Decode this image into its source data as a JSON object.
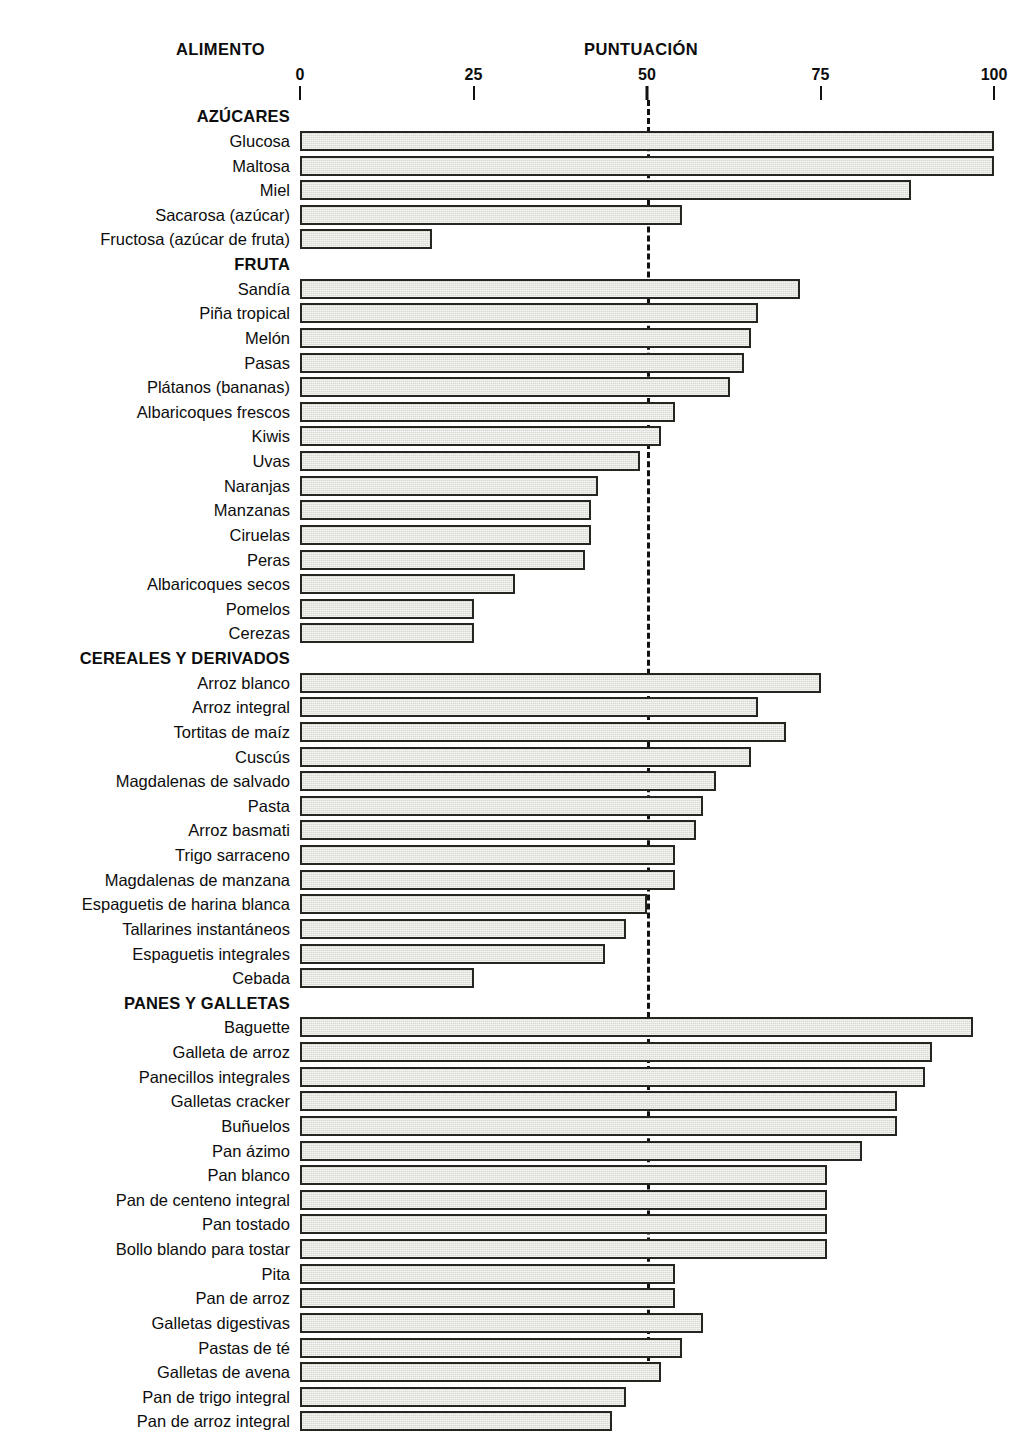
{
  "header": {
    "food_column": "ALIMENTO",
    "score_column": "PUNTUACIÓN"
  },
  "axis": {
    "ticks": [
      "0",
      "25",
      "50",
      "75",
      "100"
    ],
    "tick_values": [
      0,
      25,
      50,
      75,
      100
    ],
    "reference_line_value": 50
  },
  "chart_data": {
    "type": "bar",
    "orientation": "horizontal",
    "title": "PUNTUACIÓN",
    "xlabel": "PUNTUACIÓN",
    "ylabel": "ALIMENTO",
    "xlim": [
      0,
      100
    ],
    "xticks": [
      0,
      25,
      50,
      75,
      100
    ],
    "grid": false,
    "legend": "none",
    "annotations": [
      "Línea discontinua de referencia en 50"
    ],
    "groups": [
      {
        "name": "AZÚCARES",
        "categories": [
          "Glucosa",
          "Maltosa",
          "Miel",
          "Sacarosa (azúcar)",
          "Fructosa (azúcar de fruta)"
        ],
        "values": [
          100,
          100,
          88,
          55,
          19
        ]
      },
      {
        "name": "FRUTA",
        "categories": [
          "Sandía",
          "Piña tropical",
          "Melón",
          "Pasas",
          "Plátanos (bananas)",
          "Albaricoques frescos",
          "Kiwis",
          "Uvas",
          "Naranjas",
          "Manzanas",
          "Ciruelas",
          "Peras",
          "Albaricoques secos",
          "Pomelos",
          "Cerezas"
        ],
        "values": [
          72,
          66,
          65,
          64,
          62,
          54,
          52,
          49,
          43,
          42,
          42,
          41,
          31,
          25,
          25
        ]
      },
      {
        "name": "CEREALES Y DERIVADOS",
        "categories": [
          "Arroz blanco",
          "Arroz integral",
          "Tortitas de maíz",
          "Cuscús",
          "Magdalenas de salvado",
          "Pasta",
          "Arroz basmati",
          "Trigo sarraceno",
          "Magdalenas de manzana",
          "Espaguetis de harina blanca",
          "Tallarines instantáneos",
          "Espaguetis integrales",
          "Cebada"
        ],
        "values": [
          75,
          66,
          70,
          65,
          60,
          58,
          57,
          54,
          54,
          50,
          47,
          44,
          25
        ]
      },
      {
        "name": "PANES Y GALLETAS",
        "categories": [
          "Baguette",
          "Galleta de arroz",
          "Panecillos integrales",
          "Galletas cracker",
          "Buñuelos",
          "Pan ázimo",
          "Pan blanco",
          "Pan de centeno integral",
          "Pan tostado",
          "Bollo blando para tostar",
          "Pita",
          "Pan de arroz",
          "Galletas digestivas",
          "Pastas de té",
          "Galletas de avena",
          "Pan de trigo integral",
          "Pan de arroz integral"
        ],
        "values": [
          97,
          91,
          90,
          86,
          86,
          81,
          76,
          76,
          76,
          76,
          54,
          54,
          58,
          55,
          52,
          47,
          45
        ]
      }
    ]
  },
  "style": {
    "bar_fill": "#d9d9d4",
    "bar_border": "#26251f",
    "text_color": "#0d0d0d",
    "background": "#ffffff"
  }
}
